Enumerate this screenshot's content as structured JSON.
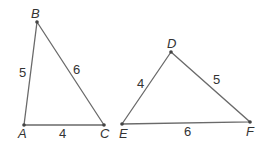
{
  "triangles": [
    {
      "name": "ABC",
      "vertices": {
        "A": "A",
        "B": "B",
        "C": "C"
      },
      "sides": {
        "AB": "5",
        "BC": "6",
        "AC": "4"
      }
    },
    {
      "name": "DEF",
      "vertices": {
        "D": "D",
        "E": "E",
        "F": "F"
      },
      "sides": {
        "DE": "4",
        "DF": "5",
        "EF": "6"
      }
    }
  ]
}
